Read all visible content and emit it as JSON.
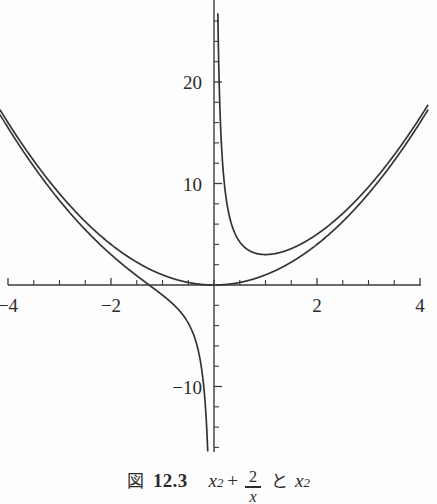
{
  "caption": {
    "figure_word": "図",
    "number": "12.3",
    "expr1_base": "x",
    "expr1_exp": "2",
    "plus": "+",
    "frac_numerator": "2",
    "frac_denominator": "x",
    "conjunction": "と",
    "expr2_base": "x",
    "expr2_exp": "2",
    "full_text": "図 12.3  x² + 2/x と x²"
  },
  "colors": {
    "background": "#fdfdfd",
    "axis": "#3a3a3a",
    "curve": "#333333",
    "text": "#2b2b2b"
  },
  "chart_data": {
    "type": "line",
    "title": "",
    "xlabel": "",
    "ylabel": "",
    "xlim": [
      -4.15,
      4.15
    ],
    "ylim": [
      -16.4,
      27.0
    ],
    "grid": false,
    "legend": "none",
    "x_ticks_major": [
      -4,
      -2,
      2,
      4
    ],
    "x_tick_labels": [
      "-4",
      "-2",
      "2",
      "4"
    ],
    "x_ticks_minor_step": 0.5,
    "y_ticks_major": [
      20,
      10,
      -10
    ],
    "y_tick_labels": [
      "20",
      "10",
      "-10"
    ],
    "y_ticks_minor_step": 2,
    "series": [
      {
        "name": "x^2 + 2/x",
        "formula": "x*x + 2/x",
        "asymptote_x": 0,
        "minimum": {
          "x": 1,
          "y": 3
        },
        "notable_points": [
          {
            "x": -4,
            "y": 15.5
          },
          {
            "x": -3,
            "y": 8.33
          },
          {
            "x": -2,
            "y": 3.0
          },
          {
            "x": -1.26,
            "y": 0.0
          },
          {
            "x": -1,
            "y": -1.0
          },
          {
            "x": -0.5,
            "y": -3.75
          },
          {
            "x": -0.2,
            "y": -9.96
          },
          {
            "x": -0.125,
            "y": -15.98
          },
          {
            "x": 0.08,
            "y": 25.01
          },
          {
            "x": 0.2,
            "y": 10.04
          },
          {
            "x": 0.5,
            "y": 4.25
          },
          {
            "x": 1,
            "y": 3.0
          },
          {
            "x": 2,
            "y": 5.0
          },
          {
            "x": 3,
            "y": 9.67
          },
          {
            "x": 4,
            "y": 16.5
          }
        ]
      },
      {
        "name": "x^2",
        "formula": "x*x",
        "minimum": {
          "x": 0,
          "y": 0
        },
        "notable_points": [
          {
            "x": -4,
            "y": 16
          },
          {
            "x": -3,
            "y": 9
          },
          {
            "x": -2,
            "y": 4
          },
          {
            "x": -1,
            "y": 1
          },
          {
            "x": 0,
            "y": 0
          },
          {
            "x": 1,
            "y": 1
          },
          {
            "x": 2,
            "y": 4
          },
          {
            "x": 3,
            "y": 9
          },
          {
            "x": 4,
            "y": 16
          }
        ]
      }
    ]
  },
  "geometry": {
    "origin_px": {
      "x": 214,
      "y": 285
    },
    "px_per_unit_x": 51.5,
    "px_per_unit_y": 10.15,
    "plot_top_px": 0,
    "plot_bottom_px": 452,
    "x_axis_left_px": 8,
    "x_axis_right_px": 421
  }
}
